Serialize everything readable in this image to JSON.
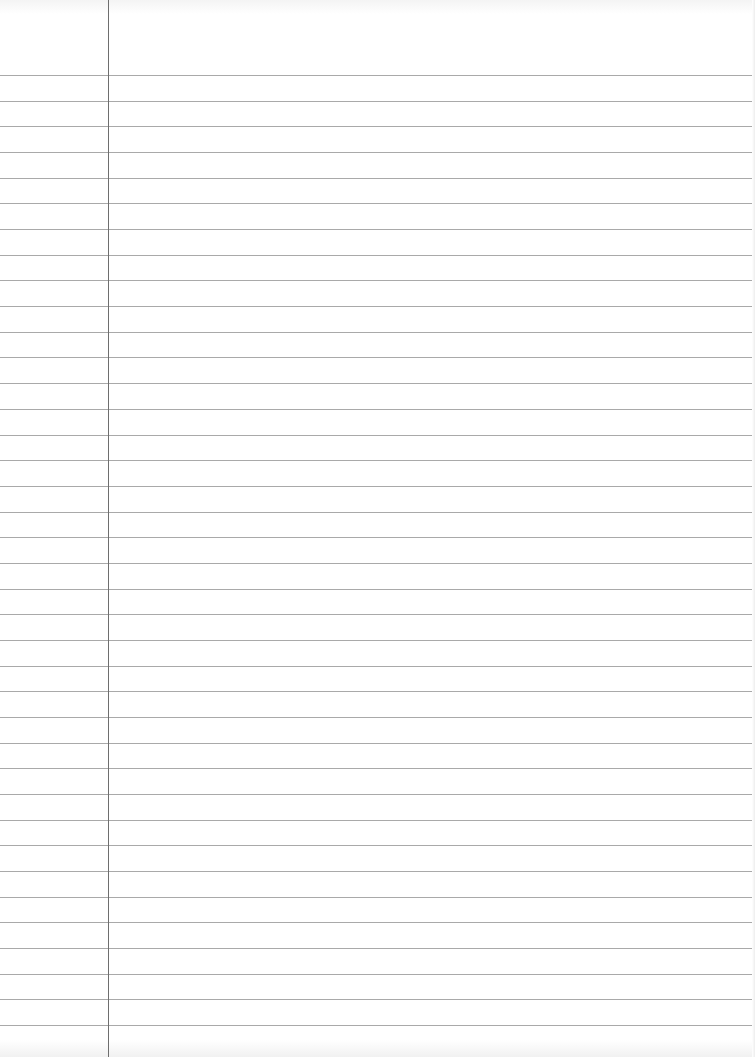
{
  "page": {
    "type": "lined-paper",
    "width": 755,
    "height": 1057,
    "background_color": "#ffffff"
  },
  "rules": {
    "count": 38,
    "first_y": 75,
    "spacing": 25.68,
    "color": "#9a9a9a"
  },
  "margin": {
    "x": 108,
    "color": "#6e6e6e"
  }
}
